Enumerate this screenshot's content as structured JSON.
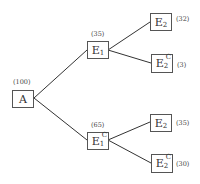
{
  "tree": {
    "root": {
      "label": "A",
      "count": "(100)"
    },
    "level1": [
      {
        "base": "E",
        "sub": "1",
        "sup": "",
        "count": "(35)"
      },
      {
        "base": "E",
        "sub": "1",
        "sup": "C",
        "count": "(65)"
      }
    ],
    "level2": [
      {
        "parent": 0,
        "base": "E",
        "sub": "2",
        "sup": "",
        "count": "(32)"
      },
      {
        "parent": 0,
        "base": "E",
        "sub": "2",
        "sup": "C",
        "count": "(3)"
      },
      {
        "parent": 1,
        "base": "E",
        "sub": "2",
        "sup": "",
        "count": "(35)"
      },
      {
        "parent": 1,
        "base": "E",
        "sub": "2",
        "sup": "C",
        "count": "(30)"
      }
    ]
  },
  "colors": {
    "line": "#333333",
    "border": "#555555"
  }
}
